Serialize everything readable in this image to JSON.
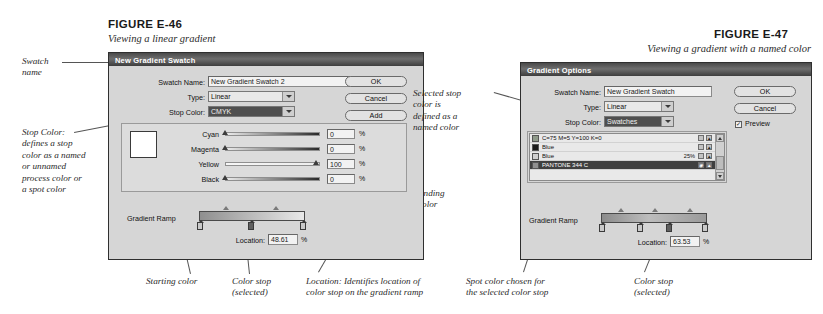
{
  "figures": [
    {
      "label": "FIGURE E-46",
      "caption": "Viewing a linear gradient",
      "dialog": {
        "title": "New Gradient Swatch",
        "fields": {
          "swatch_name_label": "Swatch Name:",
          "swatch_name_value": "New Gradient Swatch 2",
          "type_label": "Type:",
          "type_value": "Linear",
          "stop_color_label": "Stop Color:",
          "stop_color_value": "CMYK"
        },
        "buttons": [
          "OK",
          "Cancel",
          "Add"
        ],
        "sliders": [
          {
            "label": "Cyan",
            "value": "0",
            "unit": "%",
            "pos": 0
          },
          {
            "label": "Magenta",
            "value": "0",
            "unit": "%",
            "pos": 0
          },
          {
            "label": "Yellow",
            "value": "100",
            "unit": "%",
            "pos": 100
          },
          {
            "label": "Black",
            "value": "0",
            "unit": "%",
            "pos": 0
          }
        ],
        "ramp_label": "Gradient Ramp",
        "location_label": "Location:",
        "location_value": "48.61",
        "location_unit": "%",
        "ramp_start_color": "#8f8f8f",
        "ramp_end_color": "#e8e8e8",
        "stops": [
          {
            "pos": 0,
            "selected": false
          },
          {
            "pos": 48.61,
            "selected": true
          },
          {
            "pos": 100,
            "selected": false
          }
        ],
        "midpoints": [
          25,
          72
        ]
      },
      "annotations": [
        {
          "text": "Swatch\nname"
        },
        {
          "text": "Stop Color:\ndefines a stop\ncolor as a named\nor unnamed\nprocess color or\na spot color"
        },
        {
          "text": "Ending\ncolor"
        },
        {
          "text": "Starting color"
        },
        {
          "text": "Color stop\n(selected)"
        },
        {
          "text": "Location: Identifies location of\ncolor stop on the gradient ramp"
        }
      ]
    },
    {
      "label": "FIGURE E-47",
      "caption": "Viewing a gradient with a named color",
      "dialog": {
        "title": "Gradient Options",
        "fields": {
          "swatch_name_label": "Swatch Name:",
          "swatch_name_value": "New Gradient Swatch",
          "type_label": "Type:",
          "type_value": "Linear",
          "stop_color_label": "Stop Color:",
          "stop_color_value": "Swatches"
        },
        "buttons": [
          "OK",
          "Cancel"
        ],
        "preview_label": "Preview",
        "preview_checked": true,
        "swatches": [
          {
            "name": "C=75 M=5 Y=100 K=0",
            "tint": "",
            "chip": "#8f9a8a",
            "selected": false
          },
          {
            "name": "Blue",
            "tint": "",
            "chip": "#1b1b1b",
            "selected": false
          },
          {
            "name": "Blue",
            "tint": "25%",
            "chip": "#cfcfcf",
            "selected": false
          },
          {
            "name": "PANTONE 344 C",
            "tint": "",
            "chip": "#8f8f8f",
            "selected": true
          }
        ],
        "ramp_label": "Gradient Ramp",
        "location_label": "Location:",
        "location_value": "63.53",
        "location_unit": "%",
        "ramp_start_color": "#8b8b8b",
        "ramp_end_color": "#9a9a9a",
        "stops": [
          {
            "pos": 0,
            "selected": false
          },
          {
            "pos": 36,
            "selected": false
          },
          {
            "pos": 63.53,
            "selected": true
          },
          {
            "pos": 100,
            "selected": false
          }
        ],
        "midpoints": [
          18,
          50,
          82
        ]
      },
      "annotations": [
        {
          "text": "Selected stop\ncolor is\ndefined as a\nnamed color"
        },
        {
          "text": "Spot color chosen for\nthe selected color stop"
        },
        {
          "text": "Color stop\n(selected)"
        }
      ]
    }
  ]
}
